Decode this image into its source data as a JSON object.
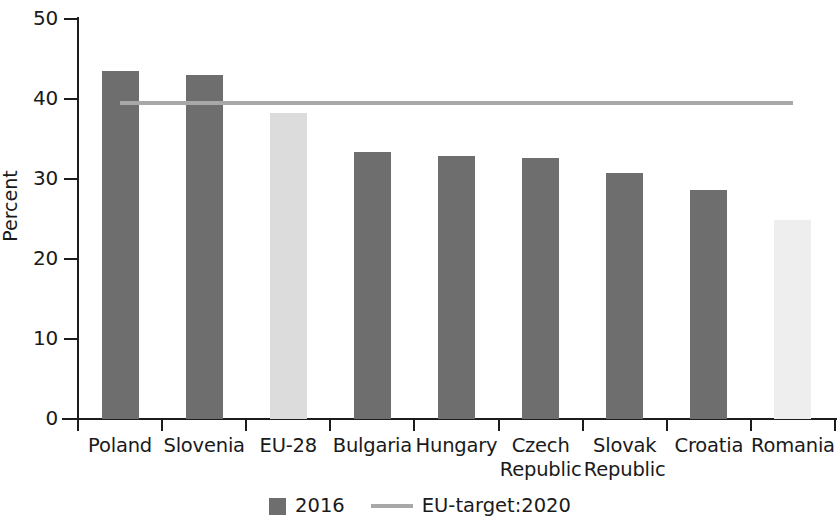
{
  "chart_data": {
    "type": "bar",
    "title": "",
    "xlabel": "",
    "ylabel": "Percent",
    "ylim": [
      0,
      50
    ],
    "yticks": [
      0,
      10,
      20,
      30,
      40,
      50
    ],
    "grid": false,
    "legend_position": "bottom",
    "categories": [
      "Poland",
      "Slovenia",
      "EU-28",
      "Bulgaria",
      "Hungary",
      "Czech Republic",
      "Slovak Republic",
      "Croatia",
      "Romania"
    ],
    "category_lines": [
      [
        "Poland"
      ],
      [
        "Slovenia"
      ],
      [
        "EU-28"
      ],
      [
        "Bulgaria"
      ],
      [
        "Hungary"
      ],
      [
        "Czech",
        "Republic"
      ],
      [
        "Slovak",
        "Republic"
      ],
      [
        "Croatia"
      ],
      [
        "Romania"
      ]
    ],
    "series": [
      {
        "name": "2016",
        "type": "bar",
        "color": "#6e6e6e",
        "values": [
          43.5,
          43.0,
          38.2,
          33.4,
          32.9,
          32.6,
          30.8,
          28.6,
          24.9
        ],
        "point_colors": [
          "#6e6e6e",
          "#6e6e6e",
          "#dcdcdc",
          "#6e6e6e",
          "#6e6e6e",
          "#6e6e6e",
          "#6e6e6e",
          "#6e6e6e",
          "#eeeeee"
        ]
      },
      {
        "name": "EU-target:2020",
        "type": "line",
        "color": "#a8a8a8",
        "value": 39.5,
        "span_categories": [
          0,
          8
        ]
      }
    ],
    "legend": [
      {
        "label": "2016",
        "marker": "square",
        "color": "#6e6e6e"
      },
      {
        "label": "EU-target:2020",
        "marker": "line",
        "color": "#a8a8a8"
      }
    ]
  },
  "axes": {
    "y_title": "Percent",
    "y_tick_labels": [
      "50",
      "40",
      "30",
      "20",
      "10",
      "0"
    ]
  }
}
